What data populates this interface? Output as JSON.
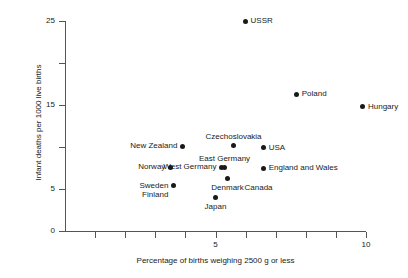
{
  "chart_data": {
    "type": "scatter",
    "title": "",
    "xlabel": "Percentage of births weighing 2500 g or less",
    "ylabel": "Infant deaths per 1000 live births",
    "xlim": [
      0,
      10
    ],
    "ylim": [
      0,
      25
    ],
    "grid": false,
    "legend": "none",
    "x_ticks_major": [
      5,
      10
    ],
    "x_tick_labels": [
      "5",
      "10"
    ],
    "x_ticks_minor": [
      1,
      2,
      3,
      4,
      6,
      7,
      8,
      9
    ],
    "y_ticks_major": [
      0,
      5,
      15,
      25
    ],
    "y_tick_labels": [
      "0",
      "5",
      "15",
      "25"
    ],
    "y_ticks_minor": [
      10,
      20
    ],
    "points": [
      {
        "name": "USSR",
        "x": 6.0,
        "y": 25.0,
        "label_pos": "right"
      },
      {
        "name": "Poland",
        "x": 7.7,
        "y": 16.3,
        "label_pos": "right"
      },
      {
        "name": "Hungary",
        "x": 9.9,
        "y": 14.8,
        "label_pos": "right"
      },
      {
        "name": "Czechoslovakia",
        "x": 5.6,
        "y": 10.2,
        "label_pos": "above"
      },
      {
        "name": "New Zealand",
        "x": 3.9,
        "y": 10.1,
        "label_pos": "left"
      },
      {
        "name": "USA",
        "x": 6.6,
        "y": 9.9,
        "label_pos": "right"
      },
      {
        "name": "East Germany",
        "x": 5.3,
        "y": 7.6,
        "label_pos": "above"
      },
      {
        "name": "Norway",
        "x": 3.5,
        "y": 7.6,
        "label_pos": "left"
      },
      {
        "name": "West Germany",
        "x": 5.2,
        "y": 7.6,
        "label_pos": "left"
      },
      {
        "name": "England and Wales",
        "x": 6.6,
        "y": 7.5,
        "label_pos": "right"
      },
      {
        "name": "Denmark",
        "x": 5.4,
        "y": 6.3,
        "label_pos": "below"
      },
      {
        "name": "Canada",
        "x": 5.4,
        "y": 6.3,
        "label_pos": "below-right"
      },
      {
        "name": "Sweden",
        "x": 3.6,
        "y": 5.4,
        "label_pos": "left"
      },
      {
        "name": "Finland",
        "x": 3.6,
        "y": 5.4,
        "label_pos": "left-below"
      },
      {
        "name": "Japan",
        "x": 5.0,
        "y": 4.0,
        "label_pos": "below"
      }
    ]
  }
}
